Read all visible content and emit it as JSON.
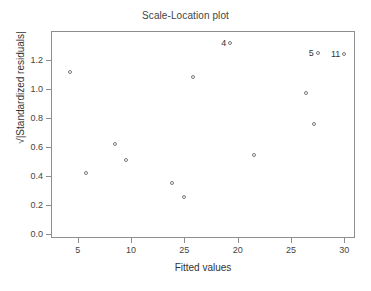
{
  "chart_data": {
    "type": "scatter",
    "title": "Scale-Location plot",
    "xlabel": "Fitted values",
    "ylabel": "√|Standardized residuals|",
    "xlim": [
      2.5,
      31.0
    ],
    "ylim": [
      -0.03,
      1.4
    ],
    "grid": false,
    "legend": null,
    "x_tick_labels": [
      "5",
      "10",
      "25",
      "20",
      "25",
      "30"
    ],
    "x_tick_values": [
      5,
      10,
      15,
      20,
      25,
      30
    ],
    "y_tick_labels": [
      "0.0",
      "0.2",
      "0.4",
      "0.6",
      "0.8",
      "1.0",
      "1.2"
    ],
    "y_tick_values": [
      0.0,
      0.2,
      0.4,
      0.6,
      0.8,
      1.0,
      1.2
    ],
    "marker": "open-circle",
    "marker_color": "#7a7a7a",
    "points": [
      {
        "x": 4.3,
        "y": 1.12,
        "label": null
      },
      {
        "x": 5.8,
        "y": 0.42,
        "label": null
      },
      {
        "x": 8.5,
        "y": 0.62,
        "label": null
      },
      {
        "x": 9.5,
        "y": 0.51,
        "label": null
      },
      {
        "x": 13.8,
        "y": 0.35,
        "label": null
      },
      {
        "x": 15.0,
        "y": 0.25,
        "label": null
      },
      {
        "x": 15.8,
        "y": 1.08,
        "label": null
      },
      {
        "x": 19.3,
        "y": 1.32,
        "label": "4"
      },
      {
        "x": 21.5,
        "y": 0.54,
        "label": null
      },
      {
        "x": 26.4,
        "y": 0.97,
        "label": null
      },
      {
        "x": 27.2,
        "y": 0.76,
        "label": null
      },
      {
        "x": 27.5,
        "y": 1.25,
        "label": "5"
      },
      {
        "x": 30.0,
        "y": 1.24,
        "label": "11"
      }
    ]
  }
}
